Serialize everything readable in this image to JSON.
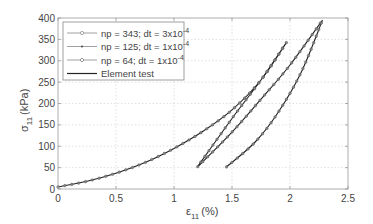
{
  "chart_data": {
    "type": "line",
    "title": "",
    "xlabel": "ε11 (%)",
    "ylabel": "σ11 (kPa)",
    "xlim": [
      0,
      2.5
    ],
    "ylim": [
      0,
      400
    ],
    "xticks": [
      "0",
      "0.5",
      "1",
      "1.5",
      "2",
      "2.5"
    ],
    "yticks": [
      "0",
      "50",
      "100",
      "150",
      "200",
      "250",
      "300",
      "350",
      "400"
    ],
    "grid": true,
    "legend_position": "upper-left",
    "legend": [
      {
        "label": "np = 343; dt = 3x10",
        "exp": "-4",
        "marker": "circle-small"
      },
      {
        "label": "np = 125; dt = 1x10",
        "exp": "-4",
        "marker": "dot"
      },
      {
        "label": "np = 64; dt = 1x10",
        "exp": "-4",
        "marker": "diamond"
      },
      {
        "label": "Element test",
        "exp": "",
        "marker": "none"
      }
    ],
    "series": [
      {
        "name": "Element test",
        "x": [
          0,
          0.25,
          0.5,
          0.75,
          1.0,
          1.25,
          1.5,
          1.75,
          1.97,
          1.75,
          1.5,
          1.2,
          1.5,
          1.75,
          2.0,
          2.28,
          2.1,
          1.9,
          1.7,
          1.45
        ],
        "y": [
          5,
          18,
          37,
          62,
          95,
          135,
          185,
          255,
          343,
          255,
          165,
          51,
          133,
          210,
          290,
          395,
          275,
          180,
          110,
          51
        ]
      }
    ],
    "note": "All three simulation series overlap the element test curve (load to ~1.97%/343 kPa, unload to ~1.2%/51 kPa, reload to ~2.28%/395 kPa, unload to ~1.45%/51 kPa)"
  },
  "axes": {
    "xlabel_main": "ε",
    "xlabel_sub": "11",
    "xlabel_unit": "(%)",
    "ylabel_main": "σ",
    "ylabel_sub": "11",
    "ylabel_unit": "(kPa)"
  }
}
